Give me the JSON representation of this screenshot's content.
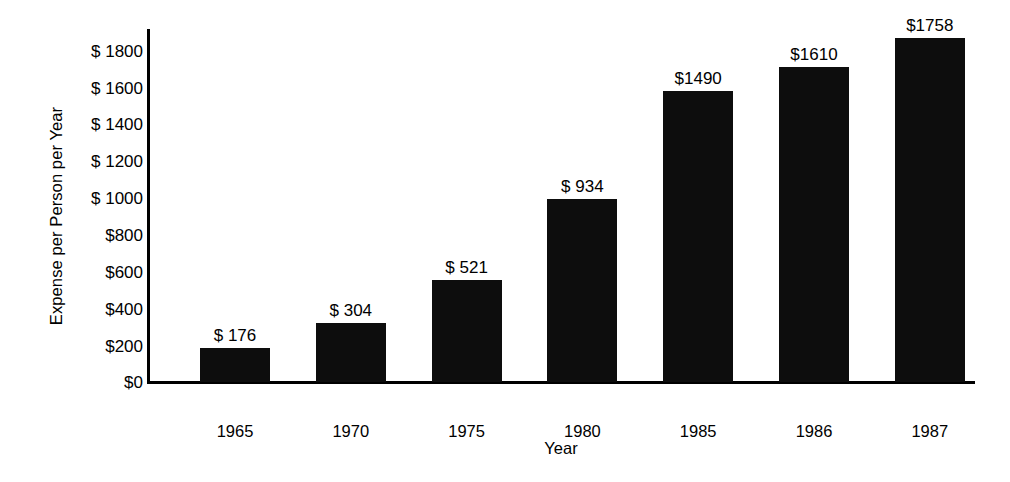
{
  "chart_data": {
    "type": "bar",
    "title": "",
    "xlabel": "Year",
    "ylabel": "Expense per Person per Year",
    "categories": [
      "1965",
      "1970",
      "1975",
      "1980",
      "1985",
      "1986",
      "1987"
    ],
    "values": [
      176,
      304,
      521,
      934,
      1490,
      1610,
      1758
    ],
    "value_labels": [
      "$ 176",
      "$ 304",
      "$ 521",
      "$ 934",
      "$1490",
      "$1610",
      "$1758"
    ],
    "ylim": [
      0,
      1800
    ],
    "ytick_values": [
      1800,
      1600,
      1400,
      1200,
      1000,
      800,
      600,
      400,
      200,
      0
    ],
    "ytick_labels": [
      "$ 1800",
      "$ 1600",
      "$ 1400",
      "$ 1200",
      "$ 1000",
      "$800",
      "$600",
      "$400",
      "$200",
      "$0"
    ],
    "grid": false,
    "legend": "none",
    "bar_color": "#0d0d0d",
    "background_color": "#ffffff",
    "axis_color": "#000000"
  }
}
